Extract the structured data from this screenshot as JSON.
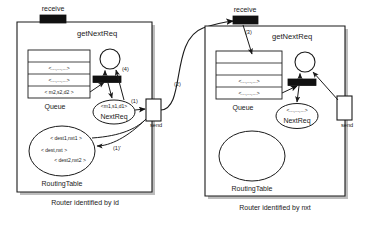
{
  "diagram": {
    "type": "petri-net-router-diagram",
    "left_panel": {
      "caption": "Router identified by id",
      "receive_port_label": "receive",
      "send_port_label": "send",
      "transition_label": "getNextReq",
      "queue_label": "Queue",
      "routing_table_label": "RoutingTable",
      "queue_rows": [
        "",
        "<...,...,...>",
        "<...,...,...>",
        "< m2,s2,d2 >"
      ],
      "nextreq_place": {
        "token": "<m1,s1,d1>",
        "name": "NextReq"
      },
      "routing_table_entries": [
        "< dest1,nxt1 >",
        "< dest,nxt >",
        "< dest2,nxt2 >"
      ],
      "arc_labels": [
        "(4)",
        "(1)",
        "(1)'"
      ]
    },
    "right_panel": {
      "caption": "Router identified by nxt",
      "receive_port_label": "receive",
      "send_port_label": "send",
      "transition_label": "getNextReq",
      "queue_label": "Queue",
      "routing_table_label": "RoutingTable",
      "queue_rows": [
        "",
        "",
        "<...,...,...>",
        "<...,...,...>"
      ],
      "nextreq_place": {
        "token": "<...,...,...>",
        "name": "NextReq"
      },
      "routing_table_entries": [],
      "arc_labels": [
        "(3)"
      ]
    },
    "inter_panel_arc_label": "(2)",
    "colors": {
      "background": "#ffffff",
      "stroke": "#1a1a1a",
      "port_fill": "#111111",
      "panel_fill": "#ffffff",
      "shadow": "#b8b8b8"
    }
  }
}
